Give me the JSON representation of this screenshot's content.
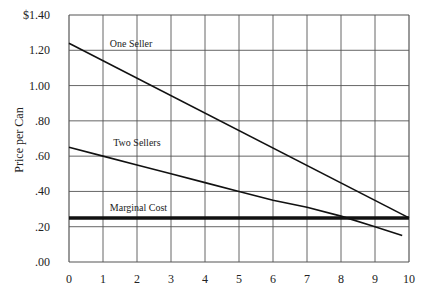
{
  "chart_data": {
    "type": "line",
    "title": "",
    "xlabel": "",
    "ylabel": "Price per Can",
    "xlim": [
      0,
      10
    ],
    "ylim": [
      0,
      1.4
    ],
    "x_ticks": [
      "0",
      "1",
      "2",
      "3",
      "4",
      "5",
      "6",
      "7",
      "8",
      "9",
      "10"
    ],
    "y_ticks": [
      ".00",
      ".20",
      ".40",
      ".60",
      ".80",
      "1.00",
      "1.20",
      "$1.40"
    ],
    "grid": true,
    "series": [
      {
        "name": "One Seller",
        "x": [
          0,
          10
        ],
        "y": [
          1.24,
          0.25
        ],
        "label_at": [
          1.2,
          1.22
        ]
      },
      {
        "name": "Two Sellers",
        "x": [
          0,
          1,
          2,
          3,
          4,
          5,
          6,
          7,
          8,
          9,
          9.8
        ],
        "y": [
          0.65,
          0.6,
          0.55,
          0.5,
          0.45,
          0.4,
          0.35,
          0.31,
          0.26,
          0.2,
          0.15
        ],
        "label_at": [
          1.3,
          0.66
        ]
      },
      {
        "name": "Marginal Cost",
        "x": [
          0,
          10
        ],
        "y": [
          0.25,
          0.25
        ],
        "label_at": [
          1.2,
          0.29
        ],
        "bold": true
      }
    ]
  }
}
